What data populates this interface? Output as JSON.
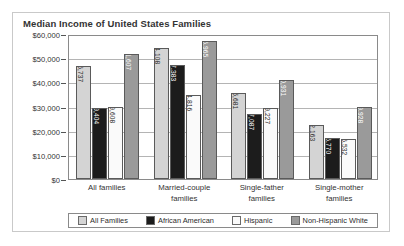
{
  "chart_data": {
    "type": "bar",
    "title": "Median Income of United States Families",
    "xlabel": "",
    "ylabel": "",
    "ylim": [
      0,
      60000
    ],
    "ytick_labels": [
      "$60,000",
      "$50,000",
      "$40,000",
      "$30,000",
      "$20,000",
      "$10,000",
      "$0"
    ],
    "ytick_values": [
      60000,
      50000,
      40000,
      30000,
      20000,
      10000,
      0
    ],
    "grid": true,
    "legend_position": "bottom",
    "categories": [
      "All families",
      "Married-couple families",
      "Single-father families",
      "Single-mother families"
    ],
    "category_lines": [
      [
        "All families"
      ],
      [
        "Married-couple",
        "families"
      ],
      [
        "Single-father",
        "families"
      ],
      [
        "Single-mother",
        "families"
      ]
    ],
    "series": [
      {
        "name": "All Families",
        "color": "#d4d4d4",
        "values": [
          46737,
          54108,
          35681,
          22163
        ],
        "labels": [
          "$46,737",
          "$54,108",
          "$35,681",
          "$22,163"
        ]
      },
      {
        "name": "African American",
        "color": "#1c1c1c",
        "values": [
          29404,
          47383,
          27087,
          16770
        ],
        "labels": [
          "$29,404",
          "$47,383",
          "$27,087",
          "$16,770"
        ]
      },
      {
        "name": "Hispanic",
        "color": "#fafafa",
        "values": [
          29608,
          34816,
          29227,
          16532
        ],
        "labels": [
          "$29,608",
          "$34,816",
          "$29,227",
          "$16,532"
        ]
      },
      {
        "name": "Non-Hispanic White",
        "color": "#9a9a9a",
        "values": [
          51607,
          56965,
          40931,
          29928
        ],
        "labels": [
          "$51,607",
          "$56,965",
          "$40,931",
          "$29,928"
        ]
      }
    ]
  }
}
